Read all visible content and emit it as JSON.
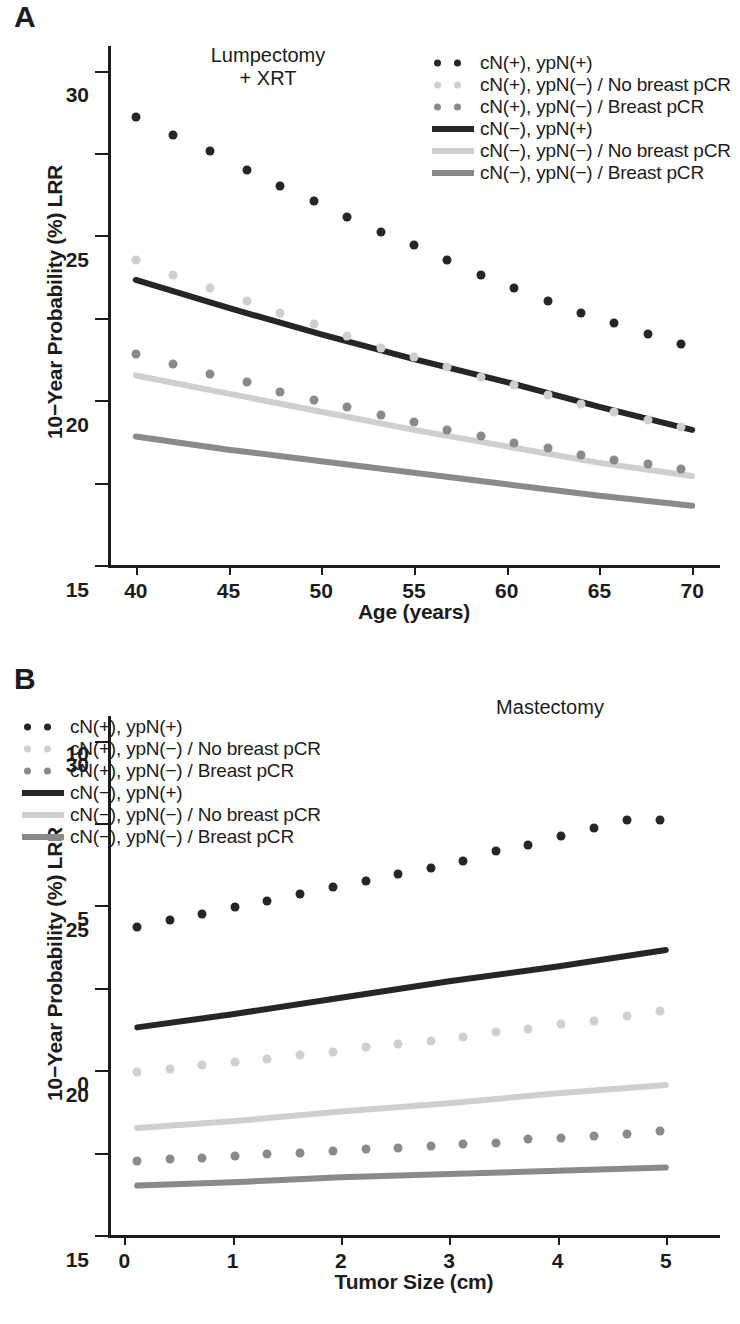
{
  "figure": {
    "panels": [
      {
        "letter": "A",
        "annotation": "Lumpectomy\n+ XRT",
        "annotation_pos": {
          "x": 232,
          "y": 44
        },
        "legend_pos": {
          "x": 428,
          "y": 52
        }
      },
      {
        "letter": "B",
        "annotation": "Mastectomy",
        "annotation_pos": {
          "x": 512,
          "y": 696
        },
        "legend_pos": {
          "x": 126,
          "y": 716
        }
      }
    ],
    "legend_entries": [
      {
        "label": "cN(+), ypN(+)",
        "marker": "dots",
        "color": "#262626"
      },
      {
        "label": "cN(+), ypN(−) / No breast pCR",
        "marker": "dots",
        "color": "#cfcfcf"
      },
      {
        "label": "cN(+), ypN(−) / Breast pCR",
        "marker": "dots",
        "color": "#8a8a8a"
      },
      {
        "label": "cN(−), ypN(+)",
        "marker": "line",
        "color": "#262626"
      },
      {
        "label": "cN(−), ypN(−) / No breast pCR",
        "marker": "line",
        "color": "#cfcfcf"
      },
      {
        "label": "cN(−), ypN(−) / Breast pCR",
        "marker": "line",
        "color": "#8a8a8a"
      }
    ]
  },
  "chart_data": [
    {
      "type": "scatter",
      "panel": "A",
      "title": "Lumpectomy + XRT",
      "xlabel": "Age (years)",
      "ylabel": "10−Year Probability (%) LRR",
      "xlim": [
        38.5,
        71.5
      ],
      "ylim": [
        0,
        31.5
      ],
      "xticks": [
        40,
        45,
        50,
        55,
        60,
        65,
        70
      ],
      "yticks": [
        0,
        5,
        10,
        15,
        20,
        25,
        30
      ],
      "grid": false,
      "legend_position": "top-right",
      "series": [
        {
          "name": "cN(+), ypN(+)",
          "style": "dots",
          "color": "#262626",
          "x": [
            40,
            42,
            44,
            46,
            47.8,
            49.6,
            51.4,
            53.2,
            55,
            56.8,
            58.6,
            60.4,
            62.2,
            64,
            65.8,
            67.6,
            69.4
          ],
          "values": [
            27.2,
            26.1,
            25.1,
            24.0,
            23.0,
            22.1,
            21.1,
            20.2,
            19.4,
            18.5,
            17.6,
            16.8,
            16.0,
            15.3,
            14.7,
            14.0,
            13.4
          ]
        },
        {
          "name": "cN(+), ypN(−) / No breast pCR",
          "style": "dots",
          "color": "#cfcfcf",
          "x": [
            40,
            42,
            44,
            46,
            47.8,
            49.6,
            51.4,
            53.2,
            55,
            56.8,
            58.6,
            60.4,
            62.2,
            64,
            65.8,
            67.6,
            69.4
          ],
          "values": [
            18.5,
            17.6,
            16.8,
            16.0,
            15.3,
            14.6,
            13.9,
            13.2,
            12.6,
            12.0,
            11.4,
            10.9,
            10.3,
            9.8,
            9.3,
            8.8,
            8.4
          ]
        },
        {
          "name": "cN(+), ypN(−) / Breast pCR",
          "style": "dots",
          "color": "#8a8a8a",
          "x": [
            40,
            42,
            44,
            46,
            47.8,
            49.6,
            51.4,
            53.2,
            55,
            56.8,
            58.6,
            60.4,
            62.2,
            64,
            65.8,
            67.6,
            69.4
          ],
          "values": [
            12.8,
            12.2,
            11.6,
            11.1,
            10.5,
            10.0,
            9.6,
            9.1,
            8.7,
            8.2,
            7.8,
            7.4,
            7.1,
            6.7,
            6.4,
            6.1,
            5.8
          ]
        },
        {
          "name": "cN(−), ypN(+)",
          "style": "line",
          "color": "#262626",
          "x": [
            40,
            45,
            50,
            55,
            60,
            65,
            70
          ],
          "values": [
            17.3,
            15.6,
            14.0,
            12.5,
            11.1,
            9.6,
            8.2
          ]
        },
        {
          "name": "cN(−), ypN(−) / No breast pCR",
          "style": "line",
          "color": "#cfcfcf",
          "x": [
            40,
            45,
            50,
            55,
            60,
            65,
            70
          ],
          "values": [
            11.5,
            10.4,
            9.3,
            8.2,
            7.2,
            6.2,
            5.4
          ]
        },
        {
          "name": "cN(−), ypN(−) / Breast pCR",
          "style": "line",
          "color": "#8a8a8a",
          "x": [
            40,
            45,
            50,
            55,
            60,
            65,
            70
          ],
          "values": [
            7.8,
            7.0,
            6.3,
            5.6,
            4.9,
            4.2,
            3.6
          ]
        }
      ]
    },
    {
      "type": "scatter",
      "panel": "B",
      "title": "Mastectomy",
      "xlabel": "Tumor Size (cm)",
      "ylabel": "10−Year Probability (%) LRR",
      "xlim": [
        -0.15,
        5.5
      ],
      "ylim": [
        0,
        31.5
      ],
      "xticks": [
        0,
        1,
        2,
        3,
        4,
        5
      ],
      "yticks": [
        0,
        5,
        10,
        15,
        20,
        25,
        30
      ],
      "grid": false,
      "legend_position": "top-left",
      "series": [
        {
          "name": "cN(+), ypN(+)",
          "style": "dots",
          "color": "#262626",
          "x": [
            0.12,
            0.42,
            0.72,
            1.02,
            1.32,
            1.62,
            1.93,
            2.23,
            2.53,
            2.83,
            3.13,
            3.43,
            3.73,
            4.03,
            4.34,
            4.64,
            4.95
          ],
          "values": [
            18.7,
            19.1,
            19.5,
            19.9,
            20.3,
            20.7,
            21.1,
            21.5,
            21.9,
            22.3,
            22.7,
            23.3,
            23.7,
            24.2,
            24.7,
            25.2,
            25.2
          ]
        },
        {
          "name": "cN(+), ypN(−) / No breast pCR",
          "style": "dots",
          "color": "#cfcfcf",
          "x": [
            0.12,
            0.42,
            0.72,
            1.02,
            1.32,
            1.62,
            1.93,
            2.23,
            2.53,
            2.83,
            3.13,
            3.43,
            3.73,
            4.03,
            4.34,
            4.64,
            4.95
          ],
          "values": [
            9.9,
            10.1,
            10.3,
            10.5,
            10.7,
            10.9,
            11.1,
            11.4,
            11.6,
            11.8,
            12.0,
            12.3,
            12.5,
            12.8,
            13.0,
            13.3,
            13.6
          ]
        },
        {
          "name": "cN(+), ypN(−) / Breast pCR",
          "style": "dots",
          "color": "#8a8a8a",
          "x": [
            0.12,
            0.42,
            0.72,
            1.02,
            1.32,
            1.62,
            1.93,
            2.23,
            2.53,
            2.83,
            3.13,
            3.43,
            3.73,
            4.03,
            4.34,
            4.64,
            4.95
          ],
          "values": [
            4.5,
            4.6,
            4.7,
            4.8,
            4.9,
            5.0,
            5.1,
            5.2,
            5.3,
            5.4,
            5.5,
            5.6,
            5.8,
            5.9,
            6.0,
            6.1,
            6.3
          ]
        },
        {
          "name": "cN(−), ypN(+)",
          "style": "line",
          "color": "#262626",
          "x": [
            0.12,
            1,
            2,
            3,
            4,
            5
          ],
          "values": [
            12.6,
            13.4,
            14.4,
            15.4,
            16.3,
            17.3
          ]
        },
        {
          "name": "cN(−), ypN(−) / No breast pCR",
          "style": "line",
          "color": "#cfcfcf",
          "x": [
            0.12,
            1,
            2,
            3,
            4,
            5
          ],
          "values": [
            6.5,
            6.9,
            7.5,
            8.0,
            8.6,
            9.1
          ]
        },
        {
          "name": "cN(−), ypN(−) / Breast pCR",
          "style": "line",
          "color": "#8a8a8a",
          "x": [
            0.12,
            1,
            2,
            3,
            4,
            5
          ],
          "values": [
            3.0,
            3.2,
            3.5,
            3.7,
            3.9,
            4.1
          ]
        }
      ]
    }
  ]
}
